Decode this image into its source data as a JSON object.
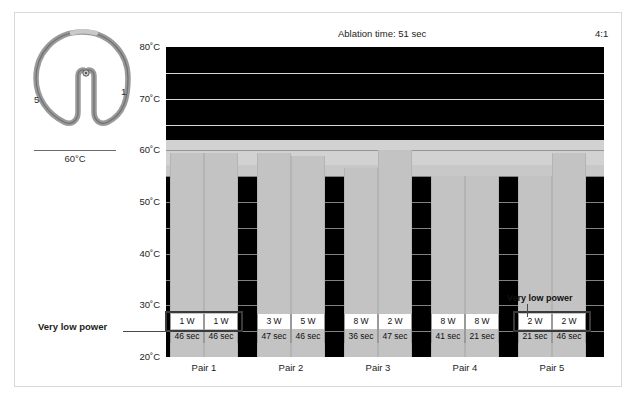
{
  "header": {
    "ablation_time": "Ablation time: 51 sec",
    "ratio": "4:1"
  },
  "catheter": {
    "label_first": "1",
    "label_last": "5",
    "icon": "circular-mapping-catheter-loop"
  },
  "scale_legend": {
    "label": "60°C"
  },
  "callouts": {
    "left": "Very low power",
    "right": "Very low power"
  },
  "axis": {
    "ticks": [
      "80˚C",
      "70˚C",
      "60˚C",
      "50˚C",
      "40˚C",
      "30˚C",
      "20˚C"
    ],
    "tick_values": [
      80,
      70,
      60,
      50,
      40,
      30,
      20
    ],
    "unit": "°C"
  },
  "colors": {
    "bar": "#c3c3c3",
    "plot_background": "#c8c8c8",
    "hot_band": "#000000",
    "light_band": "#d2d2d2",
    "highlight_border": "#3a3a3a",
    "frame": "#d9d9d9",
    "text": "#1c1c1c"
  },
  "table": {
    "row_power_suffix": "W",
    "row_time_suffix": "sec"
  },
  "chart_data": {
    "type": "bar",
    "title": "Ablation time: 51 sec",
    "xlabel": "",
    "ylabel": "°C",
    "ylim": [
      20,
      80
    ],
    "grid": true,
    "legend": "none",
    "categories": [
      "Pair 1 - a",
      "Pair 1 - b",
      "Pair 2 - a",
      "Pair 2 - b",
      "Pair 3 - a",
      "Pair 3 - b",
      "Pair 4 - a",
      "Pair 4 - b",
      "Pair 5 - a",
      "Pair 5 - b"
    ],
    "values": [
      59.5,
      59.5,
      59.5,
      59.0,
      56.5,
      60.0,
      55.0,
      55.0,
      55.0,
      59.5
    ],
    "groups": [
      {
        "name": "Pair 1",
        "bars": [
          {
            "temperature": 59.5,
            "power": "1 W",
            "time": "46 sec",
            "highlighted": true
          },
          {
            "temperature": 59.5,
            "power": "1 W",
            "time": "46 sec",
            "highlighted": true
          }
        ]
      },
      {
        "name": "Pair 2",
        "bars": [
          {
            "temperature": 59.5,
            "power": "3 W",
            "time": "47 sec",
            "highlighted": false
          },
          {
            "temperature": 59.0,
            "power": "5 W",
            "time": "46 sec",
            "highlighted": false
          }
        ]
      },
      {
        "name": "Pair 3",
        "bars": [
          {
            "temperature": 56.5,
            "power": "8 W",
            "time": "36 sec",
            "highlighted": false
          },
          {
            "temperature": 60.0,
            "power": "2 W",
            "time": "47 sec",
            "highlighted": false
          }
        ]
      },
      {
        "name": "Pair 4",
        "bars": [
          {
            "temperature": 55.0,
            "power": "8 W",
            "time": "41 sec",
            "highlighted": false
          },
          {
            "temperature": 55.0,
            "power": "8 W",
            "time": "21 sec",
            "highlighted": false
          }
        ]
      },
      {
        "name": "Pair 5",
        "bars": [
          {
            "temperature": 55.0,
            "power": "2 W",
            "time": "21 sec",
            "highlighted": true
          },
          {
            "temperature": 59.5,
            "power": "2 W",
            "time": "46 sec",
            "highlighted": true
          }
        ]
      }
    ],
    "pair_labels": [
      "Pair 1",
      "Pair 2",
      "Pair 3",
      "Pair 4",
      "Pair 5"
    ]
  }
}
